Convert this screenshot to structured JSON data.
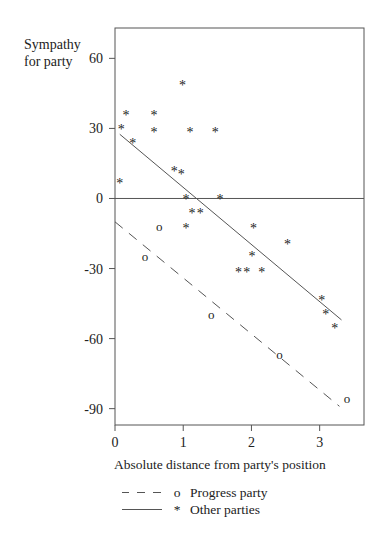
{
  "chart_data": {
    "type": "scatter",
    "title": "",
    "xlabel": "Absolute distance from party's position",
    "ylabel": "Sympathy for party",
    "ylabel_lines": [
      "Sympathy",
      "for party"
    ],
    "xlim": [
      0,
      3.65
    ],
    "ylim": [
      -97,
      73
    ],
    "x_ticks": [
      0,
      1,
      2,
      3
    ],
    "y_ticks": [
      60,
      30,
      0,
      -30,
      -60,
      -90
    ],
    "x_tick_labels": [
      "0",
      "1",
      "2",
      "3"
    ],
    "y_tick_labels": [
      "60",
      "30",
      "0",
      "-30",
      "-60",
      "-90"
    ],
    "grid": false,
    "reference_lines": [
      {
        "orientation": "horizontal",
        "y": 0
      }
    ],
    "legend_position": "below",
    "series": [
      {
        "name": "Progress party",
        "marker": "o",
        "line_style": "dashed",
        "points": [
          {
            "x": 0.65,
            "y": -12
          },
          {
            "x": 0.44,
            "y": -25
          },
          {
            "x": 1.41,
            "y": -50
          },
          {
            "x": 2.41,
            "y": -67
          },
          {
            "x": 3.4,
            "y": -86
          }
        ],
        "fit_line": {
          "x": [
            0.0,
            3.29
          ],
          "y": [
            -10,
            -89
          ]
        }
      },
      {
        "name": "Other parties",
        "marker": "*",
        "line_style": "solid",
        "points": [
          {
            "x": 0.99,
            "y": 49
          },
          {
            "x": 0.16,
            "y": 36
          },
          {
            "x": 0.57,
            "y": 36
          },
          {
            "x": 0.09,
            "y": 30
          },
          {
            "x": 0.57,
            "y": 29
          },
          {
            "x": 1.1,
            "y": 29
          },
          {
            "x": 1.47,
            "y": 29
          },
          {
            "x": 0.26,
            "y": 24
          },
          {
            "x": 0.87,
            "y": 12
          },
          {
            "x": 0.97,
            "y": 11
          },
          {
            "x": 0.07,
            "y": 7
          },
          {
            "x": 1.04,
            "y": 0
          },
          {
            "x": 1.54,
            "y": 0
          },
          {
            "x": 1.13,
            "y": -6
          },
          {
            "x": 1.25,
            "y": -6
          },
          {
            "x": 1.04,
            "y": -12
          },
          {
            "x": 2.03,
            "y": -12
          },
          {
            "x": 2.53,
            "y": -19
          },
          {
            "x": 2.01,
            "y": -24
          },
          {
            "x": 1.81,
            "y": -31
          },
          {
            "x": 1.93,
            "y": -31
          },
          {
            "x": 2.15,
            "y": -31
          },
          {
            "x": 3.03,
            "y": -43
          },
          {
            "x": 3.09,
            "y": -49
          },
          {
            "x": 3.22,
            "y": -55
          }
        ],
        "fit_line": {
          "x": [
            0.07,
            3.32
          ],
          "y": [
            27.5,
            -52
          ]
        }
      }
    ]
  },
  "legend": {
    "items": [
      {
        "label": "Progress party",
        "marker": "o",
        "line": "dashed"
      },
      {
        "label": "Other parties",
        "marker": "*",
        "line": "solid"
      }
    ]
  },
  "colors": {
    "axis": "#555555",
    "text": "#222222",
    "line": "#555555"
  }
}
